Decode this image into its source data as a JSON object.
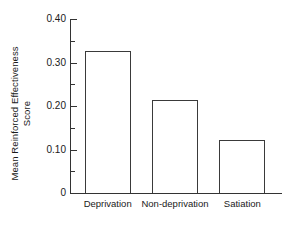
{
  "chart_data": {
    "type": "bar",
    "title": "",
    "subtitle": "",
    "xlabel": "",
    "ylabel": "Mean Reinforced Effectiveness Score",
    "ylabel_lines": [
      "Mean Reinforced Effectiveness",
      "Score"
    ],
    "categories": [
      "Deprivation",
      "Non-deprivation",
      "Satiation"
    ],
    "values": [
      0.327,
      0.213,
      0.122
    ],
    "ylim": [
      0,
      0.4
    ],
    "ytick_labels": [
      "0",
      "0.10",
      "0.20",
      "0.30",
      "0.40"
    ],
    "ytick_values": [
      0,
      0.1,
      0.2,
      0.3,
      0.4
    ],
    "yminor_tick_values": [
      0.05,
      0.15,
      0.25,
      0.35
    ],
    "grid": false,
    "legend": null,
    "bar_style": "outline",
    "bar_fill": "#ffffff",
    "bar_edge_color": "#3a3a3a",
    "axis_color": "#333333",
    "background": "#ffffff"
  },
  "axes": {
    "y_tick_0": "0",
    "y_tick_1": "0.10",
    "y_tick_2": "0.20",
    "y_tick_3": "0.30",
    "y_tick_4": "0.40",
    "ylabel_line1": "Mean Reinforced Effectiveness",
    "ylabel_line2": "Score",
    "x_cat_0": "Deprivation",
    "x_cat_1": "Non-deprivation",
    "x_cat_2": "Satiation"
  }
}
